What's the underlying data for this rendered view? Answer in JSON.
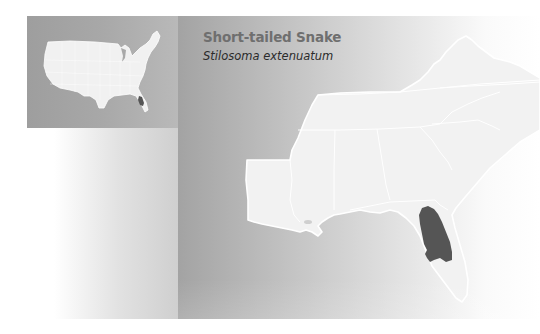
{
  "species": {
    "common_name": "Short-tailed Snake",
    "scientific_name": "Stilosoma extenuatum"
  },
  "inset_map": {
    "label": "United States overview",
    "land_color": "#f0f0f0",
    "border_color": "#ffffff",
    "range_color": "#555555"
  },
  "main_map": {
    "label": "Southeastern United States",
    "land_color": "#f2f2f2",
    "border_color": "#ffffff",
    "range_color": "#555555",
    "range_region": "Central Florida"
  },
  "colors": {
    "panel_left": "#a3a3a3",
    "panel_right": "#ffffff",
    "title_color": "#6f6f6f",
    "subtitle_color": "#2b2b2b"
  }
}
